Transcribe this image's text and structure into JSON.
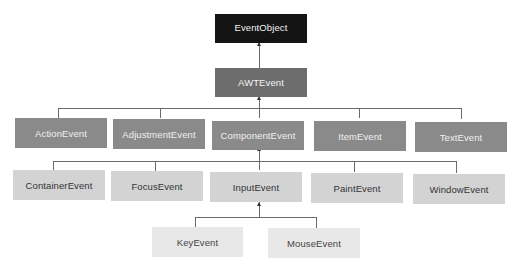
{
  "diagram": {
    "type": "class-hierarchy",
    "root": {
      "label": "EventObject"
    },
    "level1": {
      "label": "AWTEvent"
    },
    "level2": [
      {
        "label": "ActionEvent"
      },
      {
        "label": "AdjustmentEvent"
      },
      {
        "label": "ComponentEvent"
      },
      {
        "label": "ItemEvent"
      },
      {
        "label": "TextEvent"
      }
    ],
    "level3": [
      {
        "label": "ContainerEvent"
      },
      {
        "label": "FocusEvent"
      },
      {
        "label": "InputEvent"
      },
      {
        "label": "PaintEvent"
      },
      {
        "label": "WindowEvent"
      }
    ],
    "level4": [
      {
        "label": "KeyEvent"
      },
      {
        "label": "MouseEvent"
      }
    ],
    "edges": [
      [
        "AWTEvent",
        "EventObject"
      ],
      [
        "ActionEvent",
        "AWTEvent"
      ],
      [
        "AdjustmentEvent",
        "AWTEvent"
      ],
      [
        "ComponentEvent",
        "AWTEvent"
      ],
      [
        "ItemEvent",
        "AWTEvent"
      ],
      [
        "TextEvent",
        "AWTEvent"
      ],
      [
        "ContainerEvent",
        "ComponentEvent"
      ],
      [
        "FocusEvent",
        "ComponentEvent"
      ],
      [
        "InputEvent",
        "ComponentEvent"
      ],
      [
        "PaintEvent",
        "ComponentEvent"
      ],
      [
        "WindowEvent",
        "ComponentEvent"
      ],
      [
        "KeyEvent",
        "InputEvent"
      ],
      [
        "MouseEvent",
        "InputEvent"
      ]
    ],
    "colors": {
      "root": "#141414",
      "level1": "#6d6d6d",
      "level2": "#8a8a8a",
      "level3": "#d3d3d3",
      "level4": "#e8e8e8",
      "connector": "#6a6a6a"
    }
  }
}
